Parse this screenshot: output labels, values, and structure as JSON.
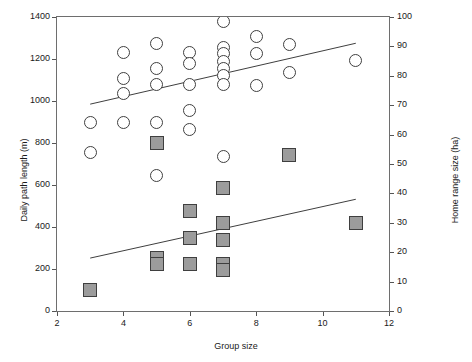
{
  "chart_data": {
    "type": "scatter",
    "title": "",
    "xlabel": "Group size",
    "ylabel": "Daily path length (m)",
    "ylabel_right": "Home range size (ha)",
    "xlim": [
      2,
      12
    ],
    "ylim_left": [
      0,
      1400
    ],
    "ylim_right": [
      0,
      100
    ],
    "xticks": [
      "2",
      "4",
      "6",
      "8",
      "10",
      "12"
    ],
    "yticks_left": [
      "0",
      "200",
      "400",
      "600",
      "800",
      "1000",
      "1200",
      "1400"
    ],
    "yticks_right": [
      "0",
      "10",
      "20",
      "30",
      "40",
      "50",
      "60",
      "70",
      "80",
      "90",
      "100"
    ],
    "grid": false,
    "legend": "none",
    "series": [
      {
        "name": "Daily path length (m)",
        "marker": "open-circle",
        "axis": "left",
        "points": [
          {
            "x": 3,
            "y": 900
          },
          {
            "x": 3,
            "y": 755
          },
          {
            "x": 4,
            "y": 1230
          },
          {
            "x": 4,
            "y": 1105
          },
          {
            "x": 4,
            "y": 1035
          },
          {
            "x": 4,
            "y": 900
          },
          {
            "x": 5,
            "y": 1275
          },
          {
            "x": 5,
            "y": 1155
          },
          {
            "x": 5,
            "y": 1080
          },
          {
            "x": 5,
            "y": 900
          },
          {
            "x": 5,
            "y": 645
          },
          {
            "x": 6,
            "y": 1230
          },
          {
            "x": 6,
            "y": 1180
          },
          {
            "x": 6,
            "y": 1080
          },
          {
            "x": 6,
            "y": 955
          },
          {
            "x": 6,
            "y": 865
          },
          {
            "x": 7,
            "y": 1380
          },
          {
            "x": 7,
            "y": 1255
          },
          {
            "x": 7,
            "y": 1225
          },
          {
            "x": 7,
            "y": 1190
          },
          {
            "x": 7,
            "y": 1155
          },
          {
            "x": 7,
            "y": 1120
          },
          {
            "x": 7,
            "y": 1080
          },
          {
            "x": 7,
            "y": 735
          },
          {
            "x": 8,
            "y": 1305
          },
          {
            "x": 8,
            "y": 1225
          },
          {
            "x": 8,
            "y": 1075
          },
          {
            "x": 9,
            "y": 1270
          },
          {
            "x": 9,
            "y": 1135
          },
          {
            "x": 11,
            "y": 1195
          }
        ]
      },
      {
        "name": "Home range size (ha)",
        "marker": "filled-square",
        "axis": "right",
        "points": [
          {
            "x": 3,
            "y": 7
          },
          {
            "x": 5,
            "y": 57
          },
          {
            "x": 5,
            "y": 18
          },
          {
            "x": 5,
            "y": 16
          },
          {
            "x": 6,
            "y": 34
          },
          {
            "x": 6,
            "y": 25
          },
          {
            "x": 6,
            "y": 16
          },
          {
            "x": 7,
            "y": 42
          },
          {
            "x": 7,
            "y": 30
          },
          {
            "x": 7,
            "y": 24
          },
          {
            "x": 7,
            "y": 16
          },
          {
            "x": 7,
            "y": 14
          },
          {
            "x": 9,
            "y": 53
          },
          {
            "x": 11,
            "y": 30
          }
        ]
      }
    ],
    "trendlines": [
      {
        "name": "daily-path-length-trend",
        "axis": "left",
        "x1": 3,
        "y1": 985,
        "x2": 11,
        "y2": 1275
      },
      {
        "name": "home-range-size-trend",
        "axis": "right",
        "x1": 3,
        "y1": 18,
        "x2": 11,
        "y2": 38
      }
    ]
  }
}
